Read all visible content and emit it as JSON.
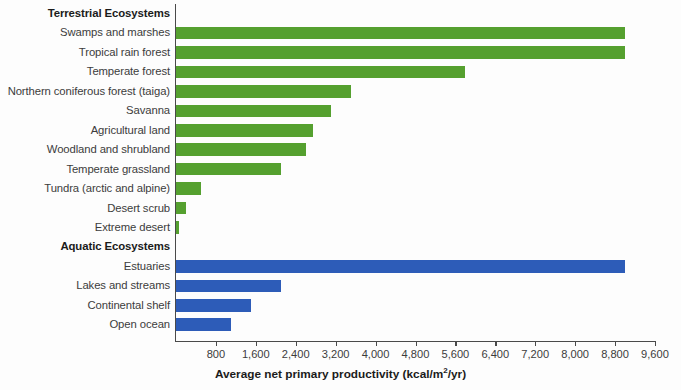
{
  "chart_data": {
    "type": "bar",
    "orientation": "horizontal",
    "title": "",
    "xlabel": "Average net primary productivity (kcal/m2/yr)",
    "xlabel_display": "Average net primary productivity (kcal/m",
    "xlabel_sup": "2",
    "xlabel_tail": "/yr)",
    "ylabel": "",
    "xlim": [
      0,
      9600
    ],
    "xticks": [
      0,
      800,
      1600,
      2400,
      3200,
      4000,
      4800,
      5600,
      6400,
      7200,
      8000,
      8800,
      9600
    ],
    "xtick_labels": [
      "",
      "800",
      "1,600",
      "2,400",
      "3,200",
      "4,000",
      "4,800",
      "5,600",
      "6,400",
      "7,200",
      "8,000",
      "8,800",
      "9,600"
    ],
    "grid": false,
    "legend": "none",
    "colors": {
      "terrestrial": "#55a02f",
      "aquatic": "#2d5cb8",
      "axis": "#4a4a4a",
      "text": "#3c3c3c",
      "background": "#fdfdfd"
    },
    "sections": [
      {
        "name": "Terrestrial Ecosystems",
        "group": "terrestrial",
        "categories": [
          "Swamps and marshes",
          "Tropical rain forest",
          "Temperate forest",
          "Northern coniferous forest (taiga)",
          "Savanna",
          "Agricultural land",
          "Woodland and shrubland",
          "Temperate grassland",
          "Tundra (arctic and alpine)",
          "Desert scrub",
          "Extreme desert"
        ],
        "values": [
          9000,
          9000,
          5800,
          3500,
          3100,
          2750,
          2600,
          2100,
          500,
          200,
          70
        ]
      },
      {
        "name": "Aquatic Ecosystems",
        "group": "aquatic",
        "categories": [
          "Estuaries",
          "Lakes and streams",
          "Continental shelf",
          "Open ocean"
        ],
        "values": [
          9000,
          2100,
          1500,
          1100
        ]
      }
    ],
    "rows": [
      {
        "label": "Terrestrial Ecosystems",
        "kind": "section",
        "value": null,
        "group": "terrestrial"
      },
      {
        "label": "Swamps and marshes",
        "kind": "bar",
        "value": 9000,
        "group": "terrestrial"
      },
      {
        "label": "Tropical rain forest",
        "kind": "bar",
        "value": 9000,
        "group": "terrestrial"
      },
      {
        "label": "Temperate forest",
        "kind": "bar",
        "value": 5800,
        "group": "terrestrial"
      },
      {
        "label": "Northern coniferous forest (taiga)",
        "kind": "bar",
        "value": 3500,
        "group": "terrestrial"
      },
      {
        "label": "Savanna",
        "kind": "bar",
        "value": 3100,
        "group": "terrestrial"
      },
      {
        "label": "Agricultural land",
        "kind": "bar",
        "value": 2750,
        "group": "terrestrial"
      },
      {
        "label": "Woodland and shrubland",
        "kind": "bar",
        "value": 2600,
        "group": "terrestrial"
      },
      {
        "label": "Temperate grassland",
        "kind": "bar",
        "value": 2100,
        "group": "terrestrial"
      },
      {
        "label": "Tundra (arctic and alpine)",
        "kind": "bar",
        "value": 500,
        "group": "terrestrial"
      },
      {
        "label": "Desert scrub",
        "kind": "bar",
        "value": 200,
        "group": "terrestrial"
      },
      {
        "label": "Extreme desert",
        "kind": "bar",
        "value": 70,
        "group": "terrestrial"
      },
      {
        "label": "Aquatic Ecosystems",
        "kind": "section",
        "value": null,
        "group": "aquatic"
      },
      {
        "label": "Estuaries",
        "kind": "bar",
        "value": 9000,
        "group": "aquatic"
      },
      {
        "label": "Lakes and streams",
        "kind": "bar",
        "value": 2100,
        "group": "aquatic"
      },
      {
        "label": "Continental shelf",
        "kind": "bar",
        "value": 1500,
        "group": "aquatic"
      },
      {
        "label": "Open ocean",
        "kind": "bar",
        "value": 1100,
        "group": "aquatic"
      }
    ]
  }
}
